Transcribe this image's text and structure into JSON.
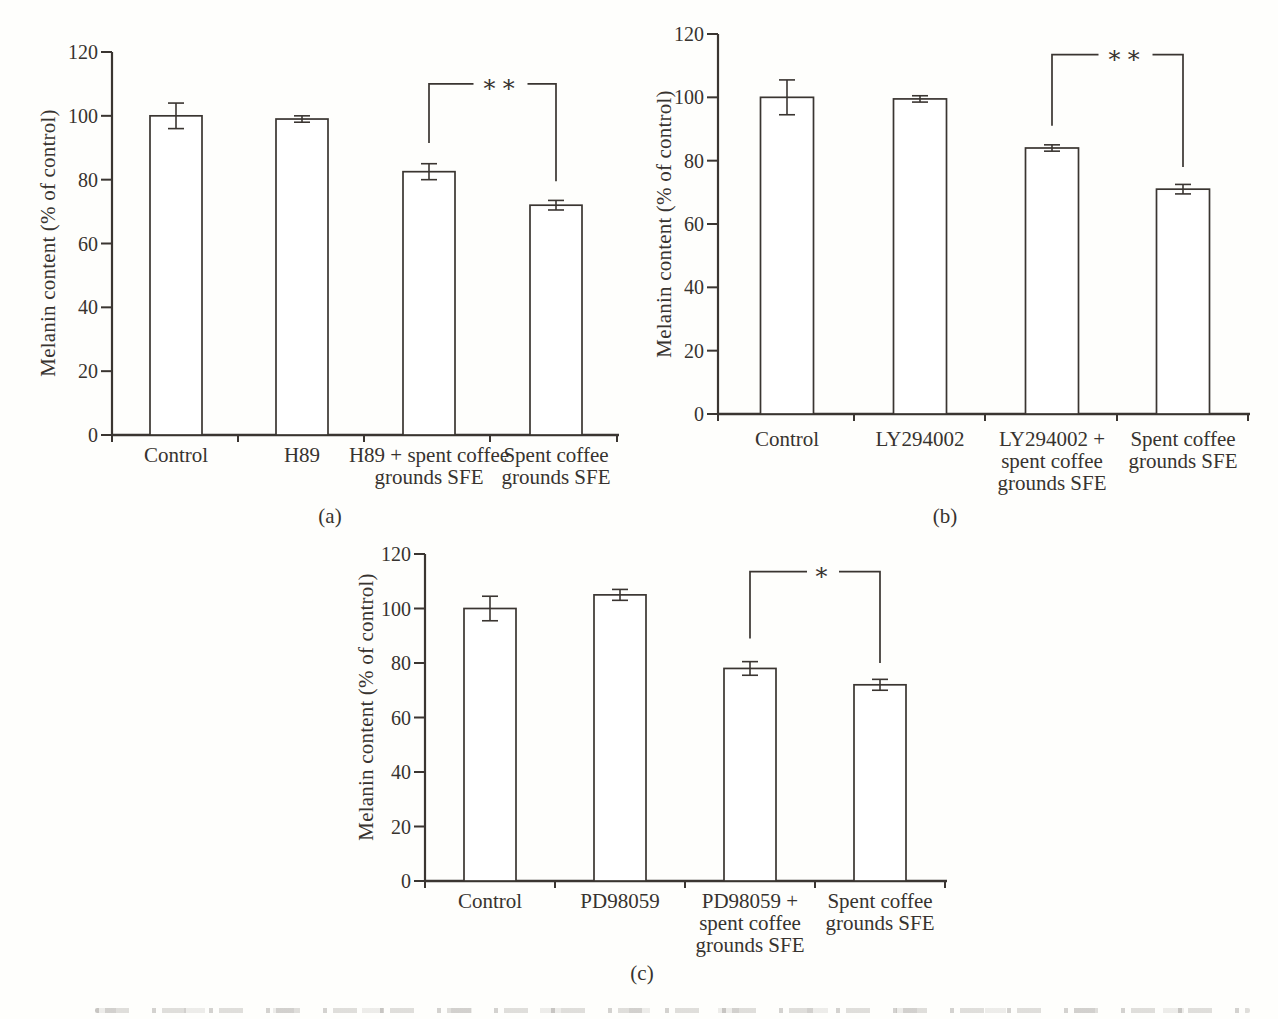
{
  "page": {
    "background": "#fefefc",
    "ink_color": "#3a3531"
  },
  "figure": {
    "ylabel": "Melanin content (% of control)",
    "panel_labels": [
      "(a)",
      "(b)",
      "(c)"
    ]
  },
  "chart_data": [
    {
      "type": "bar",
      "panel": "(a)",
      "title": "",
      "xlabel": "",
      "ylabel": "Melanin content (% of control)",
      "ylim": [
        0,
        120
      ],
      "yticks": [
        0,
        20,
        40,
        60,
        80,
        100,
        120
      ],
      "grid": false,
      "bar_fill": "#ffffff",
      "categories": [
        [
          "Control"
        ],
        [
          "H89"
        ],
        [
          "H89 + spent coffee",
          "grounds SFE"
        ],
        [
          "Spent coffee",
          "grounds SFE"
        ]
      ],
      "values": [
        100,
        99,
        82.5,
        72
      ],
      "errors": [
        4,
        1,
        2.5,
        1.5
      ],
      "significance": {
        "label": "∗∗",
        "from_category_index": 2,
        "to_category_index": 3,
        "top_value": 110,
        "left_arm_down_to": 91.5,
        "right_arm_down_to": 79.5
      }
    },
    {
      "type": "bar",
      "panel": "(b)",
      "title": "",
      "xlabel": "",
      "ylabel": "Melanin content (% of control)",
      "ylim": [
        0,
        120
      ],
      "yticks": [
        0,
        20,
        40,
        60,
        80,
        100,
        120
      ],
      "grid": false,
      "bar_fill": "#ffffff",
      "categories": [
        [
          "Control"
        ],
        [
          "LY294002"
        ],
        [
          "LY294002 +",
          "spent coffee",
          "grounds SFE"
        ],
        [
          "Spent coffee",
          "grounds SFE"
        ]
      ],
      "values": [
        100,
        99.5,
        84,
        71
      ],
      "errors": [
        5.5,
        1,
        1,
        1.5
      ],
      "significance": {
        "label": "∗∗",
        "from_category_index": 2,
        "to_category_index": 3,
        "top_value": 113.5,
        "left_arm_down_to": 91,
        "right_arm_down_to": 78
      }
    },
    {
      "type": "bar",
      "panel": "(c)",
      "title": "",
      "xlabel": "",
      "ylabel": "Melanin content (% of control)",
      "ylim": [
        0,
        120
      ],
      "yticks": [
        0,
        20,
        40,
        60,
        80,
        100,
        120
      ],
      "grid": false,
      "bar_fill": "#ffffff",
      "categories": [
        [
          "Control"
        ],
        [
          "PD98059"
        ],
        [
          "PD98059 +",
          "spent coffee",
          "grounds SFE"
        ],
        [
          "Spent coffee",
          "grounds SFE"
        ]
      ],
      "values": [
        100,
        105,
        78,
        72
      ],
      "errors": [
        4.5,
        2,
        2.5,
        2
      ],
      "significance": {
        "label": "∗",
        "from_category_index": 2,
        "to_category_index": 3,
        "top_value": 113.5,
        "left_arm_down_to": 89,
        "right_arm_down_to": 80
      }
    }
  ]
}
